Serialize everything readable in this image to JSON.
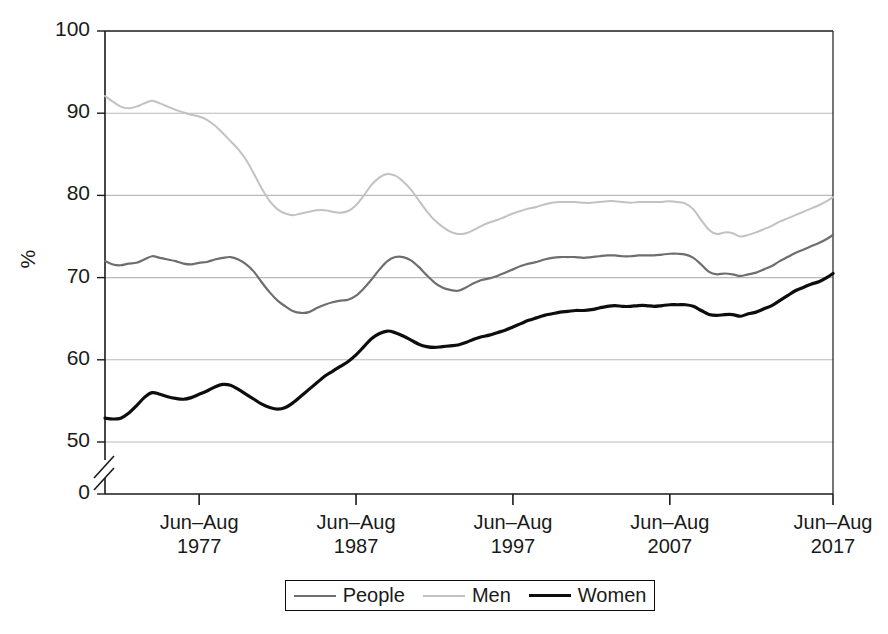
{
  "chart_data": {
    "type": "line",
    "title": "",
    "subtitle": "",
    "xlabel": "",
    "ylabel": "%",
    "ylim": [
      50,
      100
    ],
    "yticks": [
      0,
      50,
      60,
      70,
      80,
      90,
      100
    ],
    "y_axis_break": true,
    "y_axis_break_note": "axis break between 0 and 50",
    "grid": "horizontal",
    "legend_position": "bottom",
    "xticks": [
      {
        "line1": "Jun–Aug",
        "line2": "1977"
      },
      {
        "line1": "Jun–Aug",
        "line2": "1987"
      },
      {
        "line1": "Jun–Aug",
        "line2": "1997"
      },
      {
        "line1": "Jun–Aug",
        "line2": "2007"
      },
      {
        "line1": "Jun–Aug",
        "line2": "2017"
      }
    ],
    "x_start_year": 1971,
    "x_end_year": 2017,
    "colors": {
      "people": "#6e6e6e",
      "men": "#c2c2c2",
      "women": "#0d0d0d",
      "gridline": "#b9b9b9",
      "axis": "#1a1a1a"
    },
    "series": [
      {
        "name": "People",
        "color": "#6e6e6e",
        "width": 2.2,
        "x": [
          1971.0,
          1971.5,
          1972.0,
          1972.5,
          1973.0,
          1973.5,
          1974.0,
          1974.5,
          1975.0,
          1975.5,
          1976.0,
          1976.5,
          1977.0,
          1977.5,
          1978.0,
          1978.5,
          1979.0,
          1979.5,
          1980.0,
          1980.5,
          1981.0,
          1981.5,
          1982.0,
          1982.5,
          1983.0,
          1983.5,
          1984.0,
          1984.5,
          1985.0,
          1985.5,
          1986.0,
          1986.5,
          1987.0,
          1987.5,
          1988.0,
          1988.5,
          1989.0,
          1989.5,
          1990.0,
          1990.5,
          1991.0,
          1991.5,
          1992.0,
          1992.5,
          1993.0,
          1993.5,
          1994.0,
          1994.5,
          1995.0,
          1995.5,
          1996.0,
          1996.5,
          1997.0,
          1997.5,
          1998.0,
          1998.5,
          1999.0,
          1999.5,
          2000.0,
          2000.5,
          2001.0,
          2001.5,
          2002.0,
          2002.5,
          2003.0,
          2003.5,
          2004.0,
          2004.5,
          2005.0,
          2005.5,
          2006.0,
          2006.5,
          2007.0,
          2007.5,
          2008.0,
          2008.5,
          2009.0,
          2009.5,
          2010.0,
          2010.5,
          2011.0,
          2011.5,
          2012.0,
          2012.5,
          2013.0,
          2013.5,
          2014.0,
          2014.5,
          2015.0,
          2015.5,
          2016.0,
          2016.5,
          2017.0,
          2017.4
        ],
        "y": [
          72.0,
          71.6,
          71.5,
          71.7,
          71.8,
          72.2,
          72.6,
          72.4,
          72.2,
          72.0,
          71.7,
          71.6,
          71.8,
          71.9,
          72.2,
          72.4,
          72.5,
          72.2,
          71.6,
          70.7,
          69.4,
          68.2,
          67.2,
          66.5,
          65.9,
          65.7,
          65.8,
          66.3,
          66.7,
          67.0,
          67.2,
          67.3,
          67.8,
          68.7,
          69.8,
          71.0,
          72.0,
          72.5,
          72.5,
          72.1,
          71.3,
          70.3,
          69.4,
          68.8,
          68.5,
          68.4,
          68.8,
          69.3,
          69.7,
          69.9,
          70.2,
          70.6,
          71.0,
          71.4,
          71.7,
          71.9,
          72.2,
          72.4,
          72.5,
          72.5,
          72.5,
          72.4,
          72.5,
          72.6,
          72.7,
          72.7,
          72.6,
          72.6,
          72.7,
          72.7,
          72.7,
          72.8,
          72.9,
          72.9,
          72.8,
          72.4,
          71.6,
          70.7,
          70.4,
          70.5,
          70.4,
          70.2,
          70.4,
          70.6,
          71.0,
          71.4,
          72.0,
          72.5,
          73.0,
          73.4,
          73.8,
          74.2,
          74.7,
          75.2
        ]
      },
      {
        "name": "Men",
        "color": "#c2c2c2",
        "width": 2.0,
        "x": [
          1971.0,
          1971.5,
          1972.0,
          1972.5,
          1973.0,
          1973.5,
          1974.0,
          1974.5,
          1975.0,
          1975.5,
          1976.0,
          1976.5,
          1977.0,
          1977.5,
          1978.0,
          1978.5,
          1979.0,
          1979.5,
          1980.0,
          1980.5,
          1981.0,
          1981.5,
          1982.0,
          1982.5,
          1983.0,
          1983.5,
          1984.0,
          1984.5,
          1985.0,
          1985.5,
          1986.0,
          1986.5,
          1987.0,
          1987.5,
          1988.0,
          1988.5,
          1989.0,
          1989.5,
          1990.0,
          1990.5,
          1991.0,
          1991.5,
          1992.0,
          1992.5,
          1993.0,
          1993.5,
          1994.0,
          1994.5,
          1995.0,
          1995.5,
          1996.0,
          1996.5,
          1997.0,
          1997.5,
          1998.0,
          1998.5,
          1999.0,
          1999.5,
          2000.0,
          2000.5,
          2001.0,
          2001.5,
          2002.0,
          2002.5,
          2003.0,
          2003.5,
          2004.0,
          2004.5,
          2005.0,
          2005.5,
          2006.0,
          2006.5,
          2007.0,
          2007.5,
          2008.0,
          2008.5,
          2009.0,
          2009.5,
          2010.0,
          2010.5,
          2011.0,
          2011.5,
          2012.0,
          2012.5,
          2013.0,
          2013.5,
          2014.0,
          2014.5,
          2015.0,
          2015.5,
          2016.0,
          2016.5,
          2017.0,
          2017.4
        ],
        "y": [
          92.1,
          91.4,
          90.8,
          90.6,
          90.8,
          91.2,
          91.5,
          91.2,
          90.8,
          90.4,
          90.1,
          89.8,
          89.6,
          89.2,
          88.5,
          87.6,
          86.6,
          85.6,
          84.3,
          82.6,
          80.8,
          79.3,
          78.3,
          77.8,
          77.6,
          77.8,
          78.0,
          78.2,
          78.2,
          78.0,
          77.9,
          78.1,
          78.8,
          80.0,
          81.3,
          82.2,
          82.6,
          82.4,
          81.7,
          80.7,
          79.4,
          78.1,
          77.0,
          76.2,
          75.6,
          75.3,
          75.4,
          75.8,
          76.3,
          76.7,
          77.0,
          77.4,
          77.8,
          78.1,
          78.4,
          78.6,
          78.9,
          79.1,
          79.2,
          79.2,
          79.2,
          79.1,
          79.1,
          79.2,
          79.3,
          79.3,
          79.2,
          79.1,
          79.2,
          79.2,
          79.2,
          79.2,
          79.3,
          79.2,
          79.0,
          78.3,
          77.0,
          75.8,
          75.3,
          75.5,
          75.4,
          75.0,
          75.2,
          75.5,
          75.9,
          76.3,
          76.8,
          77.2,
          77.6,
          78.0,
          78.4,
          78.8,
          79.3,
          79.8
        ]
      },
      {
        "name": "Women",
        "color": "#0d0d0d",
        "width": 3.2,
        "x": [
          1971.0,
          1971.5,
          1972.0,
          1972.5,
          1973.0,
          1973.5,
          1974.0,
          1974.5,
          1975.0,
          1975.5,
          1976.0,
          1976.5,
          1977.0,
          1977.5,
          1978.0,
          1978.5,
          1979.0,
          1979.5,
          1980.0,
          1980.5,
          1981.0,
          1981.5,
          1982.0,
          1982.5,
          1983.0,
          1983.5,
          1984.0,
          1984.5,
          1985.0,
          1985.5,
          1986.0,
          1986.5,
          1987.0,
          1987.5,
          1988.0,
          1988.5,
          1989.0,
          1989.5,
          1990.0,
          1990.5,
          1991.0,
          1991.5,
          1992.0,
          1992.5,
          1993.0,
          1993.5,
          1994.0,
          1994.5,
          1995.0,
          1995.5,
          1996.0,
          1996.5,
          1997.0,
          1997.5,
          1998.0,
          1998.5,
          1999.0,
          1999.5,
          2000.0,
          2000.5,
          2001.0,
          2001.5,
          2002.0,
          2002.5,
          2003.0,
          2003.5,
          2004.0,
          2004.5,
          2005.0,
          2005.5,
          2006.0,
          2006.5,
          2007.0,
          2007.5,
          2008.0,
          2008.5,
          2009.0,
          2009.5,
          2010.0,
          2010.5,
          2011.0,
          2011.5,
          2012.0,
          2012.5,
          2013.0,
          2013.5,
          2014.0,
          2014.5,
          2015.0,
          2015.5,
          2016.0,
          2016.5,
          2017.0,
          2017.4
        ],
        "y": [
          52.9,
          52.8,
          52.9,
          53.5,
          54.4,
          55.4,
          56.0,
          55.8,
          55.5,
          55.3,
          55.2,
          55.4,
          55.8,
          56.2,
          56.7,
          57.0,
          56.9,
          56.4,
          55.8,
          55.2,
          54.6,
          54.2,
          54.0,
          54.2,
          54.8,
          55.6,
          56.4,
          57.2,
          58.0,
          58.6,
          59.2,
          59.8,
          60.6,
          61.6,
          62.6,
          63.2,
          63.5,
          63.3,
          62.9,
          62.4,
          61.9,
          61.6,
          61.5,
          61.6,
          61.7,
          61.8,
          62.1,
          62.5,
          62.8,
          63.0,
          63.3,
          63.6,
          64.0,
          64.4,
          64.8,
          65.1,
          65.4,
          65.6,
          65.8,
          65.9,
          66.0,
          66.0,
          66.1,
          66.3,
          66.5,
          66.6,
          66.5,
          66.5,
          66.6,
          66.6,
          66.5,
          66.6,
          66.7,
          66.7,
          66.7,
          66.5,
          66.0,
          65.5,
          65.4,
          65.5,
          65.5,
          65.3,
          65.6,
          65.8,
          66.2,
          66.6,
          67.2,
          67.8,
          68.4,
          68.8,
          69.2,
          69.5,
          70.0,
          70.5
        ]
      }
    ]
  },
  "axis": {
    "y_tick_labels": [
      "100",
      "90",
      "80",
      "70",
      "60",
      "50",
      "0"
    ],
    "y_axis_title": "%"
  },
  "legend": {
    "items": [
      {
        "label": "People",
        "color": "#6e6e6e",
        "width": 2.2
      },
      {
        "label": "Men",
        "color": "#c2c2c2",
        "width": 2.0
      },
      {
        "label": "Women",
        "color": "#0d0d0d",
        "width": 3.2
      }
    ]
  }
}
